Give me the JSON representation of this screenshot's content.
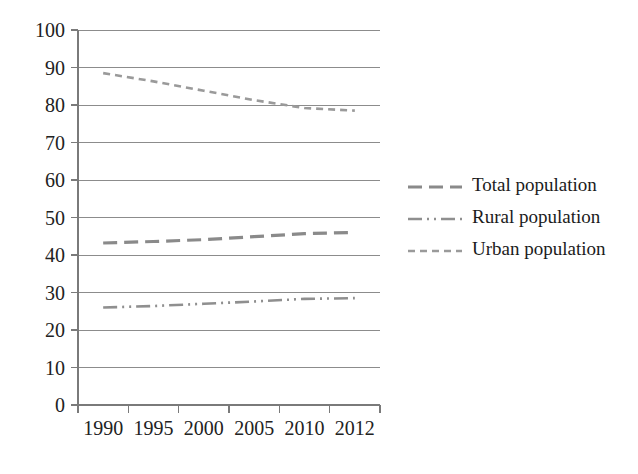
{
  "chart_data": {
    "type": "line",
    "title": "",
    "subtitle": "",
    "xlabel": "",
    "ylabel": "",
    "categories": [
      "1990",
      "1995",
      "2000",
      "2005",
      "2010",
      "2012"
    ],
    "x": [
      1990,
      1995,
      2000,
      2005,
      2010,
      2012
    ],
    "ylim": [
      0,
      100
    ],
    "ytick_step": 10,
    "yticks": [
      "0",
      "10",
      "20",
      "30",
      "40",
      "50",
      "60",
      "70",
      "80",
      "90",
      "100"
    ],
    "grid": "horizontal",
    "legend_position": "right",
    "series": [
      {
        "name": "Total population",
        "values": [
          43.2,
          43.6,
          44.1,
          44.9,
          45.7,
          46.0
        ],
        "color": "#8a8a8a",
        "dash": "14 7",
        "width": 3.2
      },
      {
        "name": "Rural population",
        "values": [
          26.0,
          26.4,
          27.0,
          27.6,
          28.3,
          28.5
        ],
        "color": "#8f8f8f",
        "dash": "14 5 2 5 2 5",
        "width": 2.6
      },
      {
        "name": "Urban population",
        "values": [
          88.5,
          86.3,
          83.8,
          81.3,
          79.2,
          78.5
        ],
        "color": "#9a9a9a",
        "dash": "7 5",
        "width": 2.6
      }
    ]
  },
  "legend": {
    "entries": [
      {
        "label": "Total population"
      },
      {
        "label": "Rural population"
      },
      {
        "label": "Urban population"
      }
    ]
  },
  "colors": {
    "background": "#ffffff",
    "gridline": "#8c8c8c",
    "axis": "#7a7a7a",
    "text": "#1d1d1d"
  }
}
